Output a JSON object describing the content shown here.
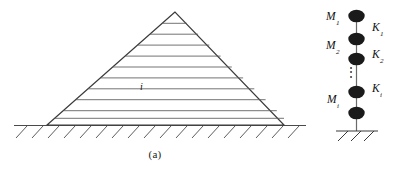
{
  "figure": {
    "panels": [
      {
        "id": "a",
        "caption": "(a)",
        "type": "layered-pyramid-on-ground",
        "layer_index_label": "i",
        "layer_count": 11
      },
      {
        "id": "b",
        "caption": "(b)",
        "type": "lumped-mass-spring-chain",
        "mass_labels": [
          "M1",
          "M2",
          "Mi"
        ],
        "spring_labels": [
          "K1",
          "K2",
          "Ki"
        ],
        "ellipsis": "⋮"
      }
    ],
    "masses": [
      {
        "symbol": "M",
        "subscript": "1"
      },
      {
        "symbol": "M",
        "subscript": "2"
      },
      {
        "symbol": "M",
        "subscript": "i"
      }
    ],
    "springs": [
      {
        "symbol": "K",
        "subscript": "1"
      },
      {
        "symbol": "K",
        "subscript": "2"
      },
      {
        "symbol": "K",
        "subscript": "i"
      }
    ],
    "colors": {
      "line": "#4a4a4a",
      "outline": "#3a3a3a",
      "node_fill": "#1a1a1a",
      "text": "#111111",
      "background": "#ffffff"
    }
  }
}
